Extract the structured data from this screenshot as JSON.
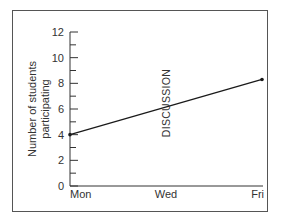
{
  "chart_data": {
    "type": "line",
    "title": "",
    "xlabel": "",
    "ylabel": "Number of students participating",
    "ylabel_lines": [
      "Number of students",
      "participating"
    ],
    "categories": [
      "Mon",
      "Wed",
      "Fri"
    ],
    "x_tick_labels": [
      "Mon",
      "Wed",
      "Fri"
    ],
    "y_tick_labels": [
      "0",
      "2",
      "4",
      "6",
      "8",
      "10",
      "12"
    ],
    "ylim": [
      0,
      12
    ],
    "y_major_step": 2,
    "y_minor_step": 1,
    "grid": false,
    "series": [
      {
        "name": "Participation",
        "points": [
          {
            "x": "Mon",
            "y": 4
          },
          {
            "x": "Fri",
            "y": 8.3
          }
        ]
      }
    ],
    "annotations": [
      {
        "text": "DISCUSSION",
        "x": "Wed",
        "orientation": "vertical"
      }
    ],
    "colors": {
      "line": "#1a1a1a",
      "axis": "#333333",
      "frame": "#555555"
    }
  }
}
